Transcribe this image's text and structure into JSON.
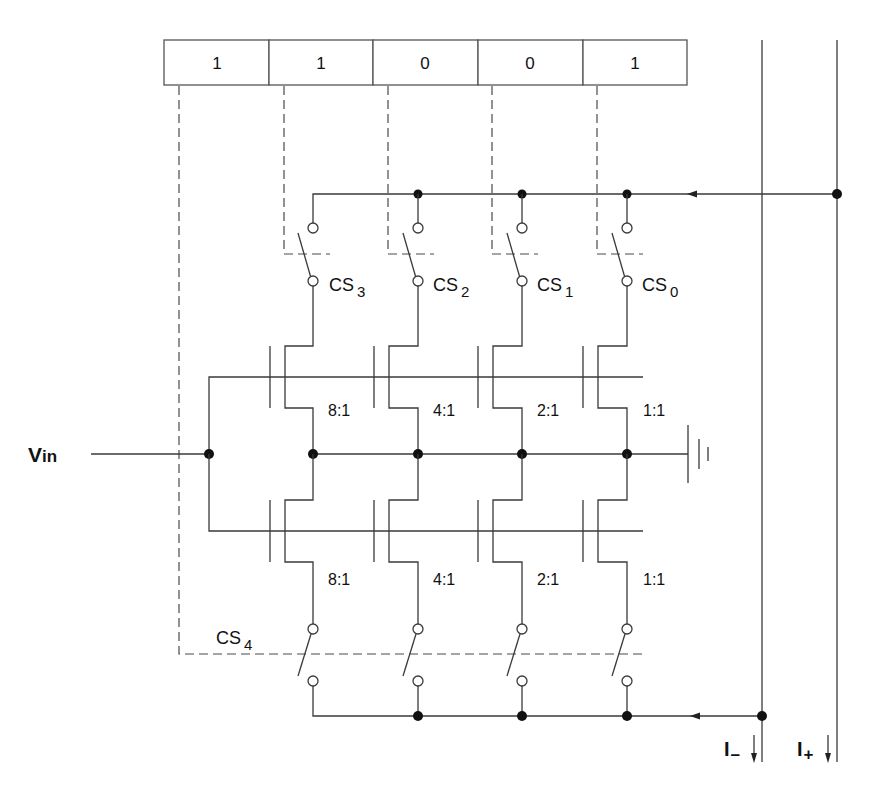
{
  "diagram": {
    "register": {
      "bits": [
        "1",
        "1",
        "0",
        "0",
        "1"
      ]
    },
    "upper_switches": [
      {
        "name": "CS",
        "sub": "3"
      },
      {
        "name": "CS",
        "sub": "2"
      },
      {
        "name": "CS",
        "sub": "1"
      },
      {
        "name": "CS",
        "sub": "0"
      }
    ],
    "upper_ratios": [
      "8:1",
      "4:1",
      "2:1",
      "1:1"
    ],
    "lower_ratios": [
      "8:1",
      "4:1",
      "2:1",
      "1:1"
    ],
    "lower_switch_control": {
      "name": "CS",
      "sub": "4"
    },
    "input_label": {
      "main": "V",
      "sub": "in"
    },
    "outputs": [
      {
        "main": "I",
        "sub": "–"
      },
      {
        "main": "I",
        "sub": "+"
      }
    ],
    "colors": {
      "line": "#3a3a3a",
      "background": "#ffffff"
    }
  }
}
